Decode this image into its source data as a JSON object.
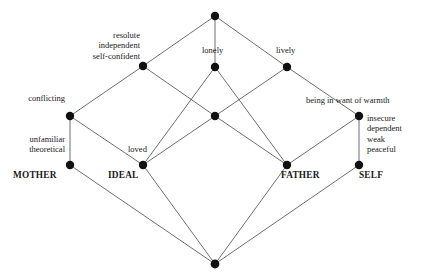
{
  "diagram": {
    "type": "concept-lattice-hasse-diagram",
    "width": 433,
    "height": 278,
    "background_color": "#ffffff",
    "node_color": "#111111",
    "edge_color": "#4a4a4a"
  },
  "nodes": [
    {
      "id": "top",
      "x": 215,
      "y": 16,
      "r": 4.2
    },
    {
      "id": "n_resolute",
      "x": 143,
      "y": 66,
      "r": 4.2
    },
    {
      "id": "n_lonely",
      "x": 215,
      "y": 67,
      "r": 4.2
    },
    {
      "id": "n_lively",
      "x": 287,
      "y": 67,
      "r": 4.2
    },
    {
      "id": "n_conflicting",
      "x": 70,
      "y": 116,
      "r": 4.2
    },
    {
      "id": "n_center",
      "x": 215,
      "y": 116,
      "r": 4.2
    },
    {
      "id": "n_warmth",
      "x": 359,
      "y": 116,
      "r": 4.2
    },
    {
      "id": "n_mother",
      "x": 70,
      "y": 165,
      "r": 4.2
    },
    {
      "id": "n_ideal",
      "x": 143,
      "y": 165,
      "r": 4.2
    },
    {
      "id": "n_father",
      "x": 287,
      "y": 165,
      "r": 4.2
    },
    {
      "id": "n_self",
      "x": 359,
      "y": 165,
      "r": 4.2
    },
    {
      "id": "bottom",
      "x": 215,
      "y": 264,
      "r": 4.4
    }
  ],
  "edges": [
    {
      "from": "top",
      "to": "n_resolute"
    },
    {
      "from": "top",
      "to": "n_lonely"
    },
    {
      "from": "top",
      "to": "n_lively"
    },
    {
      "from": "n_resolute",
      "to": "n_conflicting"
    },
    {
      "from": "n_resolute",
      "to": "n_center"
    },
    {
      "from": "n_lonely",
      "to": "n_ideal"
    },
    {
      "from": "n_lonely",
      "to": "n_father"
    },
    {
      "from": "n_lively",
      "to": "n_center"
    },
    {
      "from": "n_lively",
      "to": "n_warmth"
    },
    {
      "from": "n_conflicting",
      "to": "n_mother"
    },
    {
      "from": "n_conflicting",
      "to": "n_ideal"
    },
    {
      "from": "n_center",
      "to": "n_ideal"
    },
    {
      "from": "n_center",
      "to": "n_father"
    },
    {
      "from": "n_warmth",
      "to": "n_father"
    },
    {
      "from": "n_warmth",
      "to": "n_self"
    },
    {
      "from": "n_mother",
      "to": "bottom"
    },
    {
      "from": "n_ideal",
      "to": "bottom"
    },
    {
      "from": "n_father",
      "to": "bottom"
    },
    {
      "from": "n_self",
      "to": "bottom"
    }
  ],
  "labels": {
    "resolute_group": "resolute\nindependent\nself-confident",
    "resolute_lines": [
      "resolute",
      "independent",
      "self-confident"
    ],
    "lonely": "lonely",
    "lively": "lively",
    "conflicting": "conflicting",
    "warmth": "being in want of warmth",
    "unfamiliar_lines": [
      "unfamiliar",
      "theoretical"
    ],
    "insecure_lines": [
      "insecure",
      "dependent",
      "weak",
      "peaceful"
    ],
    "loved": "loved",
    "mother": "MOTHER",
    "ideal": "IDEAL",
    "father": "FATHER",
    "self": "SELF"
  }
}
